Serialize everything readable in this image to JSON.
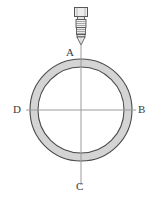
{
  "figure": {
    "background_color": "#ffffff",
    "width": 160,
    "height": 203
  },
  "labels": {
    "top": "A",
    "right": "B",
    "bottom": "C",
    "left": "D"
  },
  "ring": {
    "name": "annulus",
    "center_x": 81,
    "center_y": 110,
    "outer_radius": 51,
    "inner_radius": 43,
    "fill_color": "#d4d4d4",
    "stroke_color": "#4a4a4a",
    "stroke_width": 1
  },
  "centerlines": {
    "name": "crosshair-centerlines",
    "color": "#9a9a9a",
    "stroke_width": 1,
    "vertical": {
      "x": 81,
      "y1": 44,
      "y2": 185
    },
    "horizontal": {
      "y": 110,
      "x1": 26,
      "x2": 136
    }
  },
  "probe": {
    "name": "probe-nozzle",
    "center_x": 81,
    "top_y": 7,
    "tip_y": 45,
    "cap_color": "#e8e8e8",
    "body_color": "#efefef",
    "stroke_color": "#555555",
    "rib_count": 4
  }
}
